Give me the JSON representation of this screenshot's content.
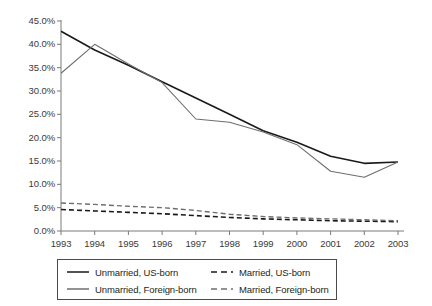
{
  "chart_data": {
    "type": "line",
    "title": "",
    "subtitle": "",
    "xlabel": "",
    "ylabel": "",
    "grid": false,
    "legend_position": "bottom",
    "categories": [
      "1993",
      "1994",
      "1995",
      "1996",
      "1997",
      "1998",
      "1999",
      "2000",
      "2001",
      "2002",
      "2003"
    ],
    "x_tick_labels": [
      "1993",
      "1994",
      "1995",
      "1996",
      "1997",
      "1998",
      "1999",
      "2000",
      "2001",
      "2002",
      "2003"
    ],
    "y_tick_labels": [
      "0.0%",
      "5.0%",
      "10.0%",
      "15.0%",
      "20.0%",
      "25.0%",
      "30.0%",
      "35.0%",
      "40.0%",
      "45.0%"
    ],
    "y_tick_values": [
      0,
      5,
      10,
      15,
      20,
      25,
      30,
      35,
      40,
      45
    ],
    "ylim": [
      0,
      45
    ],
    "y_unit": "%",
    "series": [
      {
        "name": "Unmarried, US-born",
        "color": "#1a1a1a",
        "style": "solid",
        "width": 1.6,
        "values": [
          42.8,
          38.8,
          35.5,
          32.0,
          28.5,
          25.0,
          21.5,
          19.0,
          16.0,
          14.5,
          14.8
        ]
      },
      {
        "name": "Unmarried, Foreign-born",
        "color": "#6e6e6e",
        "style": "solid",
        "width": 1.1,
        "values": [
          33.8,
          40.0,
          35.8,
          31.8,
          24.0,
          23.3,
          21.2,
          18.5,
          12.8,
          11.5,
          14.8
        ]
      },
      {
        "name": "Married, US-born",
        "color": "#1a1a1a",
        "style": "dashed",
        "width": 1.6,
        "values": [
          4.6,
          4.3,
          4.0,
          3.7,
          3.3,
          2.9,
          2.6,
          2.4,
          2.2,
          2.1,
          2.0
        ]
      },
      {
        "name": "Married, Foreign-born",
        "color": "#6e6e6e",
        "style": "dashed",
        "width": 1.4,
        "values": [
          6.0,
          5.7,
          5.3,
          5.0,
          4.4,
          3.6,
          3.1,
          2.8,
          2.6,
          2.4,
          2.2
        ]
      }
    ],
    "legend": [
      {
        "label": "Unmarried, US-born",
        "color": "#1a1a1a",
        "style": "solid"
      },
      {
        "label": "Married, US-born",
        "color": "#1a1a1a",
        "style": "dashed"
      },
      {
        "label": "Unmarried, Foreign-born",
        "color": "#6e6e6e",
        "style": "solid"
      },
      {
        "label": "Married, Foreign-born",
        "color": "#6e6e6e",
        "style": "dashed"
      }
    ],
    "axis_color": "#7a7a7a"
  }
}
